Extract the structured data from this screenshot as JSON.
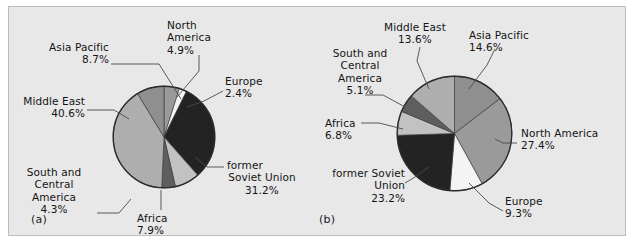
{
  "figure": {
    "panel_a_label": "(a)",
    "panel_b_label": "(b)"
  },
  "chart_data": [
    {
      "type": "pie",
      "id": "a",
      "title": "",
      "panel": "(a)",
      "categories": [
        "North America",
        "Europe",
        "former Soviet Union",
        "Africa",
        "South and Central America",
        "Middle East",
        "Asia Pacific"
      ],
      "values": [
        4.9,
        2.4,
        31.2,
        7.9,
        4.3,
        40.6,
        8.7
      ],
      "value_labels": [
        "4.9%",
        "2.4%",
        "31.2%",
        "7.9%",
        "4.3%",
        "40.6%",
        "8.7%"
      ],
      "colors": [
        "#9a9a9a",
        "#f4f4f4",
        "#232323",
        "#c2c2c2",
        "#5e5e5e",
        "#aeaeae",
        "#8f8f8f"
      ],
      "start_angle_deg": 0,
      "direction": "clockwise",
      "legend": "callouts",
      "labels": [
        {
          "name": "asia-pacific",
          "lines": [
            "Asia Pacific",
            "8.7%"
          ]
        },
        {
          "name": "north-america",
          "lines": [
            "North",
            "America",
            "4.9%"
          ]
        },
        {
          "name": "europe",
          "lines": [
            "Europe",
            "2.4%"
          ]
        },
        {
          "name": "middle-east",
          "lines": [
            "Middle East",
            "40.6%"
          ]
        },
        {
          "name": "former-soviet-union",
          "lines": [
            "former",
            "Soviet Union",
            "31.2%"
          ]
        },
        {
          "name": "south-and-central-america",
          "lines": [
            "South and",
            "Central",
            "America",
            "4.3%"
          ]
        },
        {
          "name": "africa",
          "lines": [
            "Africa",
            "7.9%"
          ]
        }
      ]
    },
    {
      "type": "pie",
      "id": "b",
      "title": "",
      "panel": "(b)",
      "categories": [
        "Asia Pacific",
        "North America",
        "Europe",
        "former Soviet Union",
        "Africa",
        "South and Central America",
        "Middle East"
      ],
      "values": [
        14.6,
        27.4,
        9.3,
        23.2,
        6.8,
        5.1,
        13.6
      ],
      "value_labels": [
        "14.6%",
        "27.4%",
        "9.3%",
        "23.2%",
        "6.8%",
        "5.1%",
        "13.6%"
      ],
      "colors": [
        "#8f8f8f",
        "#9a9a9a",
        "#f4f4f4",
        "#232323",
        "#c2c2c2",
        "#5e5e5e",
        "#aeaeae"
      ],
      "start_angle_deg": 0,
      "direction": "clockwise",
      "legend": "callouts",
      "labels": [
        {
          "name": "middle-east",
          "lines": [
            "Middle East",
            "13.6%"
          ]
        },
        {
          "name": "asia-pacific",
          "lines": [
            "Asia Pacific",
            "14.6%"
          ]
        },
        {
          "name": "north-america",
          "lines": [
            "North America",
            "27.4%"
          ]
        },
        {
          "name": "europe",
          "lines": [
            "Europe",
            "9.3%"
          ]
        },
        {
          "name": "former-soviet-union",
          "lines": [
            "former Soviet",
            "Union",
            "23.2%"
          ]
        },
        {
          "name": "africa",
          "lines": [
            "Africa",
            "6.8%"
          ]
        },
        {
          "name": "south-and-central-america",
          "lines": [
            "South and",
            "Central",
            "America",
            "5.1%"
          ]
        }
      ]
    }
  ],
  "chart_a": {
    "asia_pacific_l1": "Asia Pacific",
    "asia_pacific_l2": "8.7%",
    "north_america_l1": "North",
    "north_america_l2": "America",
    "north_america_l3": "4.9%",
    "europe_l1": "Europe",
    "europe_l2": "2.4%",
    "middle_east_l1": "Middle East",
    "middle_east_l2": "40.6%",
    "fsu_l1": "former",
    "fsu_l2": "Soviet Union",
    "fsu_l3": "31.2%",
    "sca_l1": "South and",
    "sca_l2": "Central",
    "sca_l3": "America",
    "sca_l4": "4.3%",
    "africa_l1": "Africa",
    "africa_l2": "7.9%"
  },
  "chart_b": {
    "middle_east_l1": "Middle East",
    "middle_east_l2": "13.6%",
    "asia_pacific_l1": "Asia Pacific",
    "asia_pacific_l2": "14.6%",
    "north_america_l1": "North America",
    "north_america_l2": "27.4%",
    "europe_l1": "Europe",
    "europe_l2": "9.3%",
    "fsu_l1": "former Soviet",
    "fsu_l2": "Union",
    "fsu_l3": "23.2%",
    "africa_l1": "Africa",
    "africa_l2": "6.8%",
    "sca_l1": "South and",
    "sca_l2": "Central",
    "sca_l3": "America",
    "sca_l4": "5.1%"
  }
}
